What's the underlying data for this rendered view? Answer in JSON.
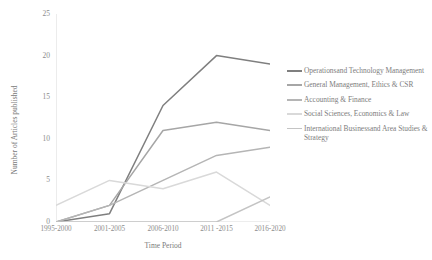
{
  "chart_data": {
    "type": "line",
    "title": "",
    "xlabel": "Time Period",
    "ylabel": "Number of Articles published",
    "categories": [
      "1995-2000",
      "2001-2005",
      "2006-2010",
      "2011 -2015",
      "2016-2020"
    ],
    "yticks": [
      0,
      5,
      10,
      15,
      20,
      25
    ],
    "ylim": [
      0,
      25
    ],
    "grid": false,
    "legend_position": "right",
    "series": [
      {
        "name": "Operationsand Technology Management",
        "color": "#7f7f7f",
        "values": [
          0,
          1,
          14,
          20,
          19
        ]
      },
      {
        "name": "General Management, Ethics & CSR",
        "color": "#a6a6a6",
        "values": [
          0,
          2,
          11,
          12,
          11
        ]
      },
      {
        "name": "Accounting & Finance",
        "color": "#b5b5b5",
        "values": [
          0,
          2,
          5,
          8,
          9
        ]
      },
      {
        "name": "Social Sciences, Economics & Law",
        "color": "#d9d9d9",
        "values": [
          2,
          5,
          4,
          6,
          2
        ]
      },
      {
        "name": "International Businessand Area Studies & Strategy",
        "color": "#c4c4c4",
        "values": [
          0,
          0,
          0,
          0,
          3
        ]
      }
    ]
  },
  "axis": {
    "y_title": "Number of Articles published",
    "x_title": "Time Period"
  }
}
